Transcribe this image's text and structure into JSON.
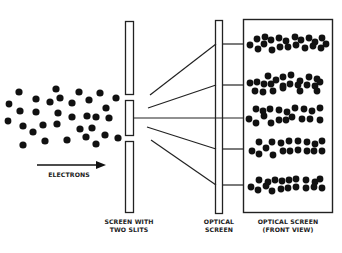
{
  "diagram": {
    "labels": {
      "electrons": "ELECTRONS",
      "slit_screen": "SCREEN WITH\nTWO SLITS",
      "optical_screen": "OPTICAL\nSCREEN",
      "front_view": "OPTICAL SCREEN\n(FRONT VIEW)"
    },
    "colors": {
      "ink": "#111111",
      "background": "#ffffff"
    },
    "electron_count": 40,
    "fringe_count": 5
  }
}
